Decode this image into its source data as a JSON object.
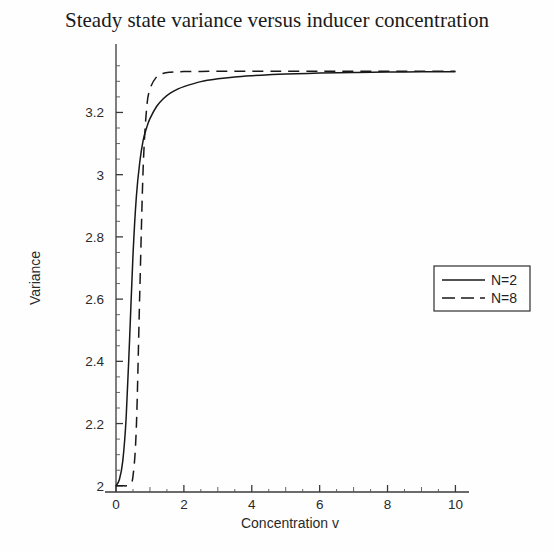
{
  "chart_data": {
    "type": "line",
    "title": "Steady state variance versus inducer concentration",
    "xlabel": "Concentration v",
    "ylabel": "Variance",
    "xlim": [
      0,
      10.4
    ],
    "ylim": [
      1.98,
      3.42
    ],
    "grid": false,
    "legend_position": "center-right",
    "xticks": [
      "0",
      "2",
      "4",
      "6",
      "8",
      "10"
    ],
    "xtick_values": [
      0,
      2,
      4,
      6,
      8,
      10
    ],
    "yticks": [
      "2",
      "2.2",
      "2.4",
      "2.6",
      "2.8",
      "3",
      "3.2"
    ],
    "ytick_values": [
      2,
      2.2,
      2.4,
      2.6,
      2.8,
      3,
      3.2
    ],
    "x": [
      0,
      0.1,
      0.2,
      0.3,
      0.4,
      0.5,
      0.6,
      0.7,
      0.8,
      0.9,
      1.0,
      1.2,
      1.4,
      1.6,
      1.8,
      2.0,
      2.5,
      3.0,
      3.5,
      4.0,
      4.5,
      5.0,
      6.0,
      7.0,
      8.0,
      9.0,
      10.0
    ],
    "series": [
      {
        "name": "N=2",
        "style": "solid",
        "color": "#181818",
        "values": [
          2.0,
          2.02,
          2.08,
          2.22,
          2.47,
          2.74,
          2.93,
          3.04,
          3.11,
          3.15,
          3.18,
          3.22,
          3.245,
          3.262,
          3.274,
          3.283,
          3.299,
          3.308,
          3.314,
          3.318,
          3.321,
          3.3235,
          3.3265,
          3.3285,
          3.3297,
          3.3306,
          3.3312
        ]
      },
      {
        "name": "N=8",
        "style": "dashed",
        "color": "#181818",
        "values": [
          2.0,
          2.0,
          2.0,
          2.0,
          2.005,
          2.03,
          2.19,
          2.62,
          3.02,
          3.21,
          3.275,
          3.315,
          3.326,
          3.3295,
          3.3308,
          3.3314,
          3.332,
          3.3322,
          3.3323,
          3.3324,
          3.3324,
          3.3325,
          3.3325,
          3.3326,
          3.3326,
          3.3326,
          3.3326
        ]
      }
    ],
    "legend_entries": [
      {
        "label": "N=2",
        "style": "solid"
      },
      {
        "label": "N=8",
        "style": "dashed"
      }
    ]
  }
}
